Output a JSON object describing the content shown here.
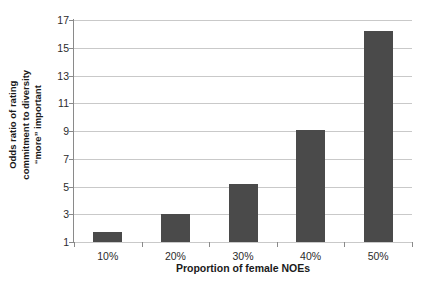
{
  "chart_data": {
    "type": "bar",
    "title": "",
    "subtitle": "",
    "categories": [
      "10%",
      "20%",
      "30%",
      "40%",
      "50%"
    ],
    "values": [
      1.7,
      3.0,
      5.2,
      9.1,
      16.2
    ],
    "series": [
      {
        "name": "Odds ratio",
        "values": [
          1.7,
          3.0,
          5.2,
          9.1,
          16.2
        ]
      }
    ],
    "xlabel": "Proportion of female NOEs",
    "ylabel": "Odds ratio of rating commitment to diversity \"more\" important",
    "ylabel_lines": [
      "Odds ratio of rating",
      "commitment to diversity",
      "“more” important"
    ],
    "ylim": [
      1,
      17
    ],
    "yticks": [
      1,
      3,
      5,
      7,
      9,
      11,
      13,
      15,
      17
    ],
    "ytick_labels": [
      "1",
      "3",
      "5",
      "7",
      "9",
      "11",
      "13",
      "15",
      "17"
    ],
    "xtick_labels": [
      "10%",
      "20%",
      "30%",
      "40%",
      "50%"
    ],
    "grid": "horizontal",
    "legend": "none",
    "bar_color": "#4a4a4a",
    "gridline_color": "#c9c9c9",
    "axis_color": "#8a8a8a",
    "background_color": "#ffffff",
    "annotations": []
  }
}
